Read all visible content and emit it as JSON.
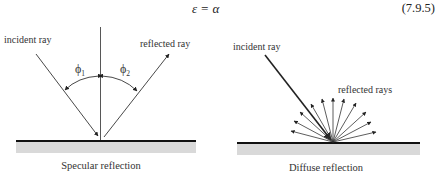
{
  "equation": {
    "text": "ε = α",
    "number": "(7.9.5)"
  },
  "figures": [
    {
      "name": "specular",
      "caption": "Specular reflection",
      "labels": {
        "incident": "incident ray",
        "reflected": "reflected ray",
        "angle1": "ϕ",
        "angle1_sub": "1",
        "angle2": "ϕ",
        "angle2_sub": "2"
      }
    },
    {
      "name": "diffuse",
      "caption": "Diffuse reflection",
      "labels": {
        "incident": "incident ray",
        "reflected": "reflected rays"
      }
    }
  ],
  "colors": {
    "line": "#333333",
    "surface": "#111111",
    "surface_fill": "#d9d9d9"
  }
}
